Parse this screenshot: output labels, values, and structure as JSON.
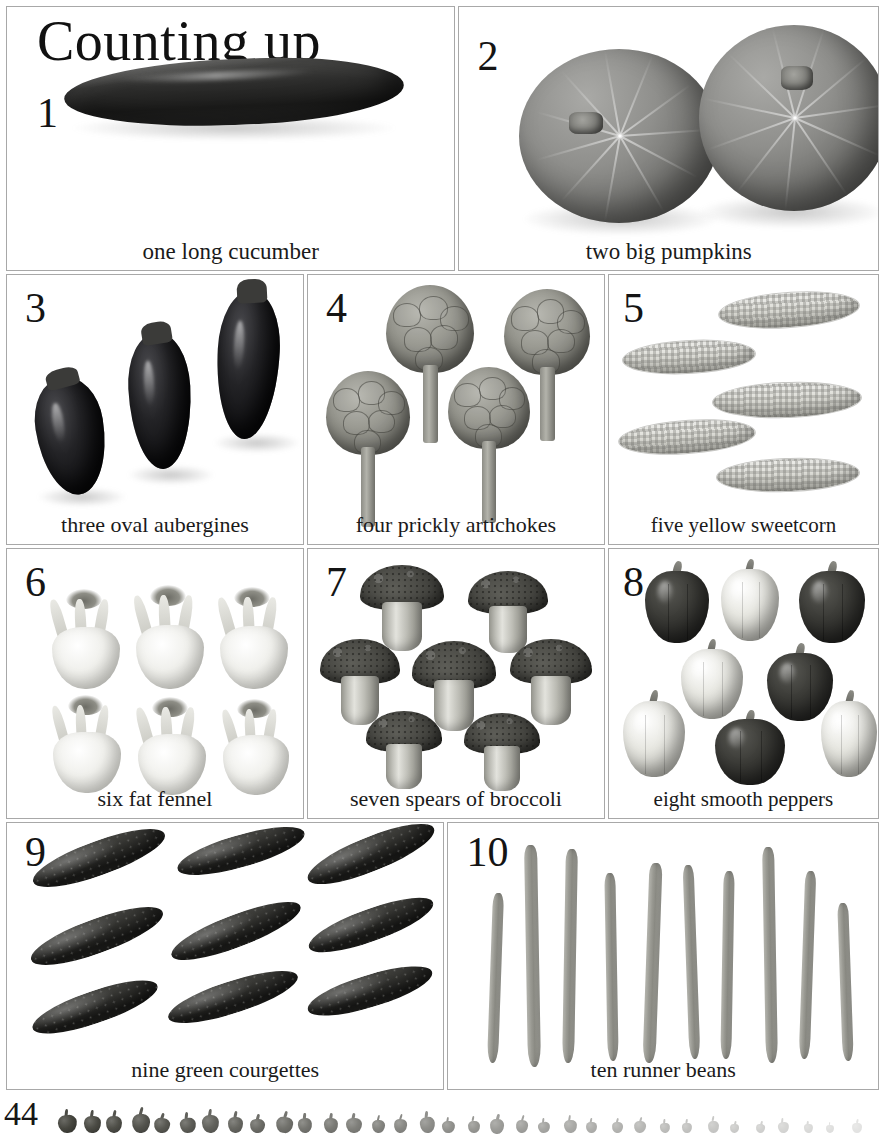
{
  "page": {
    "title": "Counting up",
    "folio": "44",
    "background_color": "#ffffff",
    "border_color": "#a8a8a8",
    "text_color": "#161616"
  },
  "panels": [
    {
      "numeral": "1",
      "caption": "one long cucumber",
      "count": 1,
      "subject": "cucumber"
    },
    {
      "numeral": "2",
      "caption": "two big pumpkins",
      "count": 2,
      "subject": "pumpkin"
    },
    {
      "numeral": "3",
      "caption": "three oval aubergines",
      "count": 3,
      "subject": "aubergine"
    },
    {
      "numeral": "4",
      "caption": "four prickly artichokes",
      "count": 4,
      "subject": "artichoke"
    },
    {
      "numeral": "5",
      "caption": "five yellow sweetcorn",
      "count": 5,
      "subject": "sweetcorn"
    },
    {
      "numeral": "6",
      "caption": "six fat fennel",
      "count": 6,
      "subject": "fennel"
    },
    {
      "numeral": "7",
      "caption": "seven spears of broccoli",
      "count": 7,
      "subject": "broccoli"
    },
    {
      "numeral": "8",
      "caption": "eight smooth peppers",
      "count": 8,
      "subject": "pepper"
    },
    {
      "numeral": "9",
      "caption": "nine green courgettes",
      "count": 9,
      "subject": "courgette"
    },
    {
      "numeral": "10",
      "caption": "ten runner beans",
      "count": 10,
      "subject": "runner bean"
    }
  ]
}
